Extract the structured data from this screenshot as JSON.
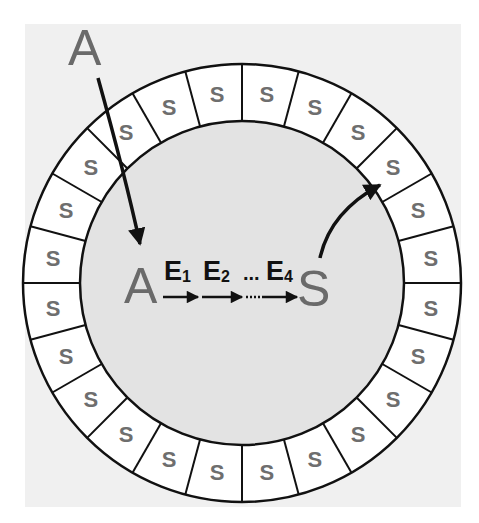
{
  "diagram": {
    "outside_substrate": {
      "label": "A"
    },
    "inner_pathway": {
      "start": "A",
      "end": "S",
      "enzymes": [
        {
          "letter": "E",
          "sub": "1"
        },
        {
          "letter": "E",
          "sub": "2"
        },
        {
          "letter": "E",
          "sub": "4"
        }
      ],
      "ellipsis": "..."
    },
    "ring": {
      "segment_count": 24,
      "segment_label": "S"
    },
    "colors": {
      "background_panel": "#f0f0f0",
      "inner_disc": "#e3e3e3",
      "ring_fill": "#ffffff",
      "stroke": "#111111",
      "label_gray": "#6e6e6e"
    }
  }
}
